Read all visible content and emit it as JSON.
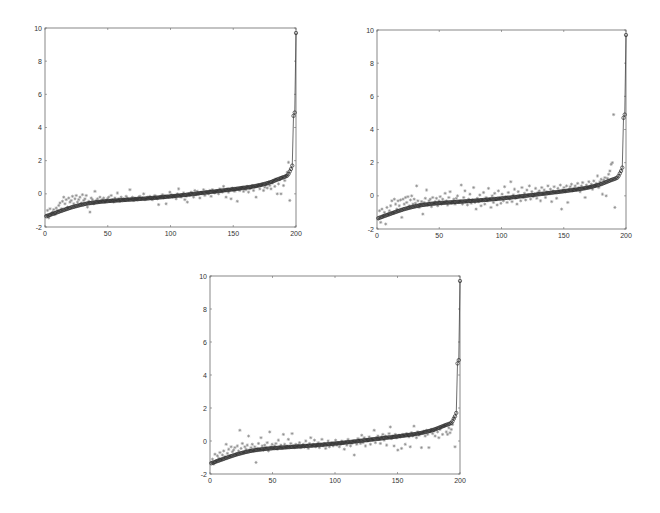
{
  "figure": {
    "background": "#ffffff",
    "axis_color": "#6a6a6a",
    "true_color": "#2e2e2e",
    "est_color": "#8a8a8a"
  },
  "chart_data": [
    {
      "type": "line",
      "title": "",
      "xlabel": "",
      "ylabel": "",
      "xlim": [
        0,
        200
      ],
      "ylim": [
        -2,
        10
      ],
      "xticks": [
        0,
        50,
        100,
        150,
        200
      ],
      "yticks": [
        -2,
        0,
        2,
        4,
        6,
        8,
        10
      ],
      "grid": false,
      "legend": null,
      "series": [
        {
          "name": "sorted true values",
          "marker": "o",
          "line": true,
          "ref": "true_curve"
        },
        {
          "name": "estimates",
          "marker": "*",
          "line": false,
          "ref": "est_a"
        }
      ],
      "box": {
        "left": 45,
        "top": 28,
        "right": 296,
        "bottom": 227
      }
    },
    {
      "type": "line",
      "title": "",
      "xlabel": "",
      "ylabel": "",
      "xlim": [
        0,
        200
      ],
      "ylim": [
        -2,
        10
      ],
      "xticks": [
        0,
        50,
        100,
        150,
        200
      ],
      "yticks": [
        -2,
        0,
        2,
        4,
        6,
        8,
        10
      ],
      "grid": false,
      "legend": null,
      "series": [
        {
          "name": "sorted true values",
          "marker": "o",
          "line": true,
          "ref": "true_curve"
        },
        {
          "name": "estimates",
          "marker": "*",
          "line": false,
          "ref": "est_b"
        }
      ],
      "box": {
        "left": 377,
        "top": 30,
        "right": 626,
        "bottom": 229
      }
    },
    {
      "type": "line",
      "title": "",
      "xlabel": "",
      "ylabel": "",
      "xlim": [
        0,
        200
      ],
      "ylim": [
        -2,
        10
      ],
      "xticks": [
        0,
        50,
        100,
        150,
        200
      ],
      "yticks": [
        -2,
        0,
        2,
        4,
        6,
        8,
        10
      ],
      "grid": false,
      "legend": null,
      "series": [
        {
          "name": "sorted true values",
          "marker": "o",
          "line": true,
          "ref": "true_curve"
        },
        {
          "name": "estimates",
          "marker": "*",
          "line": false,
          "ref": "est_c"
        }
      ],
      "box": {
        "left": 210,
        "top": 276,
        "right": 460,
        "bottom": 474
      }
    }
  ],
  "series_values": {
    "x_range": [
      1,
      200
    ],
    "true_curve": [
      -1.35,
      -1.32,
      -1.3,
      -1.27,
      -1.24,
      -1.21,
      -1.19,
      -1.16,
      -1.13,
      -1.11,
      -1.08,
      -1.05,
      -1.03,
      -1.0,
      -0.97,
      -0.95,
      -0.92,
      -0.9,
      -0.87,
      -0.85,
      -0.82,
      -0.8,
      -0.78,
      -0.76,
      -0.74,
      -0.72,
      -0.7,
      -0.68,
      -0.66,
      -0.65,
      -0.63,
      -0.61,
      -0.6,
      -0.58,
      -0.57,
      -0.56,
      -0.55,
      -0.54,
      -0.53,
      -0.52,
      -0.51,
      -0.5,
      -0.49,
      -0.48,
      -0.47,
      -0.47,
      -0.46,
      -0.45,
      -0.45,
      -0.44,
      -0.43,
      -0.43,
      -0.42,
      -0.42,
      -0.41,
      -0.41,
      -0.4,
      -0.4,
      -0.39,
      -0.39,
      -0.38,
      -0.38,
      -0.37,
      -0.37,
      -0.36,
      -0.36,
      -0.35,
      -0.35,
      -0.34,
      -0.34,
      -0.33,
      -0.33,
      -0.32,
      -0.32,
      -0.31,
      -0.31,
      -0.3,
      -0.3,
      -0.29,
      -0.29,
      -0.28,
      -0.28,
      -0.27,
      -0.26,
      -0.26,
      -0.25,
      -0.25,
      -0.24,
      -0.23,
      -0.23,
      -0.22,
      -0.21,
      -0.21,
      -0.2,
      -0.19,
      -0.19,
      -0.18,
      -0.17,
      -0.17,
      -0.16,
      -0.15,
      -0.14,
      -0.14,
      -0.13,
      -0.12,
      -0.11,
      -0.11,
      -0.1,
      -0.09,
      -0.08,
      -0.07,
      -0.07,
      -0.06,
      -0.05,
      -0.04,
      -0.03,
      -0.02,
      -0.02,
      -0.01,
      0.0,
      0.01,
      0.02,
      0.03,
      0.04,
      0.05,
      0.05,
      0.06,
      0.07,
      0.08,
      0.09,
      0.1,
      0.11,
      0.12,
      0.13,
      0.13,
      0.14,
      0.15,
      0.16,
      0.17,
      0.18,
      0.19,
      0.2,
      0.21,
      0.22,
      0.22,
      0.23,
      0.24,
      0.25,
      0.26,
      0.27,
      0.28,
      0.29,
      0.3,
      0.31,
      0.32,
      0.33,
      0.34,
      0.35,
      0.36,
      0.37,
      0.38,
      0.39,
      0.4,
      0.41,
      0.42,
      0.44,
      0.45,
      0.46,
      0.48,
      0.49,
      0.51,
      0.52,
      0.54,
      0.56,
      0.58,
      0.6,
      0.62,
      0.64,
      0.66,
      0.69,
      0.71,
      0.74,
      0.77,
      0.8,
      0.83,
      0.86,
      0.89,
      0.92,
      0.95,
      0.98,
      1.0,
      1.03,
      1.06,
      1.1,
      1.2,
      1.35,
      1.5,
      1.7,
      4.7,
      4.9,
      9.7
    ],
    "est_a": [
      -1.3,
      -1.0,
      -1.45,
      -0.9,
      -1.2,
      -1.1,
      -0.95,
      -1.25,
      -0.85,
      -1.0,
      -0.7,
      -0.55,
      -0.9,
      -0.45,
      -0.2,
      -0.6,
      -0.35,
      -0.8,
      -0.25,
      -0.5,
      -0.4,
      -0.15,
      -0.6,
      -0.3,
      -0.1,
      -0.5,
      -0.35,
      -0.2,
      -0.55,
      -0.05,
      -0.4,
      -0.3,
      -0.1,
      -0.8,
      -0.45,
      -1.1,
      -0.25,
      -0.35,
      -0.6,
      0.15,
      -0.4,
      -0.3,
      -0.5,
      -0.2,
      -0.45,
      -0.35,
      -0.25,
      -0.5,
      -0.4,
      -0.3,
      -0.2,
      -0.45,
      -0.1,
      -0.35,
      -0.5,
      -0.25,
      -0.4,
      0.05,
      -0.3,
      -0.45,
      -0.2,
      -0.35,
      -0.3,
      -0.4,
      -0.15,
      -0.25,
      -0.35,
      0.25,
      -0.3,
      -0.2,
      -0.4,
      -0.25,
      -0.3,
      -0.35,
      -0.2,
      -0.15,
      -0.3,
      -0.25,
      0.0,
      -0.35,
      -0.3,
      -0.2,
      -0.25,
      -0.15,
      -0.3,
      -0.35,
      -0.2,
      -0.1,
      -0.25,
      -0.3,
      -0.65,
      -0.2,
      -0.15,
      -0.05,
      -0.25,
      -0.1,
      -0.6,
      -0.15,
      -0.2,
      0.1,
      -0.05,
      -0.2,
      -0.1,
      -0.15,
      -0.3,
      0.0,
      0.3,
      -0.1,
      -0.2,
      -0.05,
      0.05,
      -0.35,
      -0.15,
      -0.5,
      0.0,
      -0.1,
      0.1,
      0.05,
      -0.2,
      0.2,
      -0.05,
      0.15,
      0.0,
      -0.25,
      0.1,
      0.05,
      0.25,
      -0.1,
      0.15,
      0.1,
      0.0,
      0.2,
      -0.15,
      0.25,
      0.1,
      0.05,
      0.15,
      0.2,
      0.0,
      0.3,
      0.15,
      0.1,
      0.45,
      0.2,
      -0.2,
      0.3,
      0.1,
      0.25,
      -0.3,
      0.35,
      0.2,
      0.15,
      0.3,
      -0.45,
      0.25,
      0.2,
      0.35,
      0.4,
      0.15,
      0.3,
      0.25,
      0.45,
      0.1,
      0.3,
      0.35,
      0.5,
      0.2,
      0.4,
      -0.2,
      0.45,
      0.55,
      0.3,
      0.5,
      0.6,
      0.2,
      0.4,
      0.55,
      0.35,
      0.7,
      0.5,
      0.3,
      0.65,
      0.8,
      0.45,
      0.9,
      0.0,
      0.6,
      0.85,
      0.0,
      1.0,
      0.5,
      0.8,
      1.1,
      1.3,
      1.9,
      -0.4
    ],
    "est_b": [
      -1.4,
      -0.9,
      -1.6,
      -0.8,
      -1.2,
      -1.0,
      -1.7,
      -0.7,
      -1.1,
      -0.9,
      -0.6,
      -0.3,
      -1.0,
      -0.2,
      -0.5,
      -0.8,
      -0.3,
      -0.6,
      -0.25,
      -1.3,
      -0.2,
      -0.5,
      -0.1,
      -0.4,
      -0.05,
      -0.6,
      -0.25,
      0.0,
      -0.5,
      -0.2,
      -0.45,
      0.6,
      -0.3,
      -0.7,
      -0.5,
      -0.35,
      -1.1,
      -0.4,
      -0.15,
      0.35,
      -0.55,
      -0.3,
      -0.2,
      -0.65,
      -0.1,
      -0.45,
      -0.35,
      -0.15,
      -0.6,
      -0.3,
      -0.05,
      -0.5,
      -0.2,
      -0.4,
      0.15,
      -0.3,
      -0.55,
      -0.1,
      0.25,
      -0.45,
      -0.35,
      -0.2,
      -0.5,
      -0.15,
      0.0,
      -0.4,
      -0.3,
      0.65,
      -0.5,
      -0.1,
      0.3,
      -0.35,
      -0.55,
      -0.2,
      0.1,
      -0.45,
      -0.25,
      0.5,
      -0.4,
      -0.8,
      -0.15,
      -0.35,
      0.05,
      -0.6,
      -0.25,
      0.2,
      -0.5,
      -0.1,
      -0.3,
      0.45,
      -0.2,
      -0.7,
      0.0,
      -0.4,
      0.15,
      -0.25,
      -0.55,
      0.3,
      -0.15,
      -0.45,
      0.1,
      -0.3,
      0.55,
      -0.05,
      -0.4,
      0.2,
      -0.2,
      0.85,
      -0.35,
      0.05,
      0.4,
      -0.15,
      -0.5,
      0.25,
      0.0,
      -0.3,
      0.5,
      -0.1,
      0.15,
      -0.25,
      0.35,
      0.05,
      0.6,
      -0.2,
      0.25,
      -0.05,
      0.1,
      0.45,
      -0.15,
      0.2,
      0.3,
      -0.3,
      0.5,
      0.1,
      0.35,
      -0.1,
      0.25,
      0.6,
      0.15,
      0.4,
      -0.35,
      0.3,
      0.55,
      0.2,
      -0.15,
      0.45,
      0.3,
      0.65,
      -0.8,
      0.35,
      0.5,
      0.25,
      0.6,
      -0.4,
      0.4,
      0.55,
      0.7,
      0.3,
      0.45,
      0.6,
      0.35,
      0.75,
      0.5,
      0.25,
      0.6,
      0.8,
      0.45,
      -0.1,
      0.65,
      0.5,
      0.85,
      0.55,
      0.7,
      0.4,
      0.9,
      0.6,
      0.75,
      1.2,
      0.5,
      0.85,
      1.0,
      0.1,
      0.95,
      1.1,
      0.0,
      1.05,
      1.3,
      1.5,
      1.9,
      2.0,
      4.9,
      -0.7
    ],
    "est_c": [
      -1.3,
      -1.1,
      -1.4,
      -0.8,
      -1.2,
      -0.9,
      -1.05,
      -0.7,
      -1.1,
      -0.85,
      -0.6,
      -0.95,
      -0.2,
      -0.75,
      -0.5,
      -0.9,
      -0.35,
      -0.65,
      -0.55,
      -0.4,
      -0.8,
      -0.3,
      -0.6,
      0.65,
      -0.45,
      -0.15,
      -0.7,
      -0.35,
      -0.5,
      -0.25,
      0.3,
      -0.55,
      -0.4,
      -0.2,
      -0.6,
      -0.35,
      -1.3,
      -0.45,
      -0.15,
      -0.5,
      0.2,
      -0.3,
      -0.55,
      -0.25,
      -0.4,
      -0.1,
      -0.6,
      0.55,
      -0.35,
      -0.2,
      -0.45,
      -0.3,
      -0.15,
      -0.5,
      0.05,
      -0.35,
      -0.25,
      -0.45,
      0.4,
      -0.2,
      -0.4,
      -0.3,
      0.1,
      -0.35,
      -0.15,
      0.45,
      -0.3,
      -0.4,
      -0.2,
      -0.35,
      -0.25,
      -0.1,
      -0.4,
      -0.3,
      -0.2,
      -0.35,
      0.0,
      -0.25,
      -0.45,
      -0.15,
      0.2,
      -0.3,
      -0.2,
      0.05,
      -0.35,
      -0.25,
      -0.1,
      -0.4,
      -0.2,
      0.1,
      -0.3,
      -0.15,
      -0.45,
      -0.25,
      0.0,
      -0.35,
      -0.2,
      -0.1,
      -0.3,
      -0.15,
      0.05,
      -0.25,
      -0.1,
      -0.35,
      -0.2,
      0.0,
      -0.15,
      -0.5,
      -0.05,
      -0.25,
      0.1,
      -0.1,
      -0.3,
      -0.15,
      0.0,
      -0.85,
      -0.05,
      -0.2,
      0.15,
      0.05,
      -0.15,
      0.35,
      -0.1,
      0.2,
      -0.3,
      0.1,
      0.0,
      0.25,
      -0.2,
      0.15,
      0.05,
      0.65,
      -0.1,
      0.2,
      0.3,
      0.1,
      -0.15,
      0.25,
      0.4,
      0.05,
      0.3,
      -0.25,
      0.2,
      0.45,
      0.85,
      0.15,
      0.3,
      -0.3,
      0.4,
      0.2,
      -0.55,
      0.35,
      0.25,
      -0.45,
      0.4,
      0.3,
      -0.2,
      0.45,
      0.35,
      0.25,
      -0.35,
      0.5,
      0.3,
      0.9,
      0.4,
      0.2,
      0.55,
      0.35,
      0.45,
      -0.4,
      0.5,
      0.6,
      0.3,
      0.65,
      0.4,
      -0.4,
      0.55,
      0.7,
      0.45,
      0.6,
      0.3,
      0.75,
      0.55,
      0.2,
      0.7,
      0.85,
      0.4,
      0.9,
      0.95,
      0.55,
      0.4,
      0.8,
      0.5,
      0.7,
      1.0,
      1.4,
      -0.35
    ]
  }
}
